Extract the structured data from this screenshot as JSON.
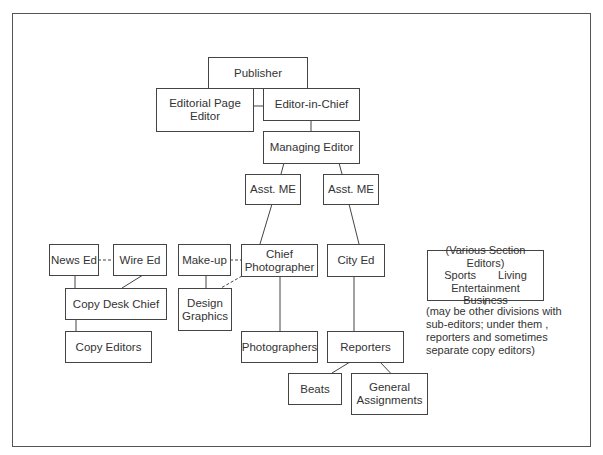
{
  "diagram": {
    "type": "organizational-chart",
    "nodes": {
      "publisher": {
        "label": "Publisher"
      },
      "editorial_page_editor": {
        "line1": "Editorial Page",
        "line2": "Editor"
      },
      "editor_in_chief": {
        "label": "Editor-in-Chief"
      },
      "managing_editor": {
        "label": "Managing Editor"
      },
      "asst_me_left": {
        "label": "Asst. ME"
      },
      "asst_me_right": {
        "label": "Asst. ME"
      },
      "news_ed": {
        "label": "News Ed"
      },
      "wire_ed": {
        "label": "Wire Ed"
      },
      "copy_desk_chief": {
        "label": "Copy Desk Chief"
      },
      "copy_editors": {
        "label": "Copy Editors"
      },
      "make_up": {
        "label": "Make-up"
      },
      "chief_photographer": {
        "line1": "Chief",
        "line2": "Photographer"
      },
      "design_graphics": {
        "line1": "Design",
        "line2": "Graphics"
      },
      "city_ed": {
        "label": "City Ed"
      },
      "photographers": {
        "label": "Photographers"
      },
      "reporters": {
        "label": "Reporters"
      },
      "beats": {
        "label": "Beats"
      },
      "general_assignments": {
        "line1": "General",
        "line2": "Assignments"
      },
      "section_editors": {
        "title": "(Various Section Editors)",
        "item1": "Sports",
        "item2": "Living",
        "item3": "Entertainment",
        "item4": "Business"
      }
    },
    "note": {
      "line1": "(may be other divisions with",
      "line2": "sub-editors; under them ,",
      "line3": "reporters and sometimes",
      "line4": "separate copy editors)"
    },
    "edges": [
      [
        "publisher",
        "editorial_page_editor",
        "solid"
      ],
      [
        "publisher",
        "editor_in_chief",
        "solid"
      ],
      [
        "editorial_page_editor",
        "editor_in_chief",
        "solid"
      ],
      [
        "editor_in_chief",
        "managing_editor",
        "solid"
      ],
      [
        "managing_editor",
        "asst_me_left",
        "solid"
      ],
      [
        "managing_editor",
        "asst_me_right",
        "solid"
      ],
      [
        "asst_me_left",
        "chief_photographer",
        "solid"
      ],
      [
        "asst_me_right",
        "city_ed",
        "solid"
      ],
      [
        "news_ed",
        "wire_ed",
        "dashed"
      ],
      [
        "news_ed",
        "copy_desk_chief",
        "solid"
      ],
      [
        "wire_ed",
        "copy_desk_chief",
        "solid"
      ],
      [
        "copy_desk_chief",
        "copy_editors",
        "solid"
      ],
      [
        "make_up",
        "chief_photographer",
        "dashed"
      ],
      [
        "make_up",
        "design_graphics",
        "solid"
      ],
      [
        "chief_photographer",
        "design_graphics",
        "dashed"
      ],
      [
        "chief_photographer",
        "photographers",
        "solid"
      ],
      [
        "city_ed",
        "reporters",
        "solid"
      ],
      [
        "reporters",
        "beats",
        "solid"
      ],
      [
        "reporters",
        "general_assignments",
        "solid"
      ],
      [
        "section_editors",
        "note",
        "solid"
      ]
    ]
  }
}
